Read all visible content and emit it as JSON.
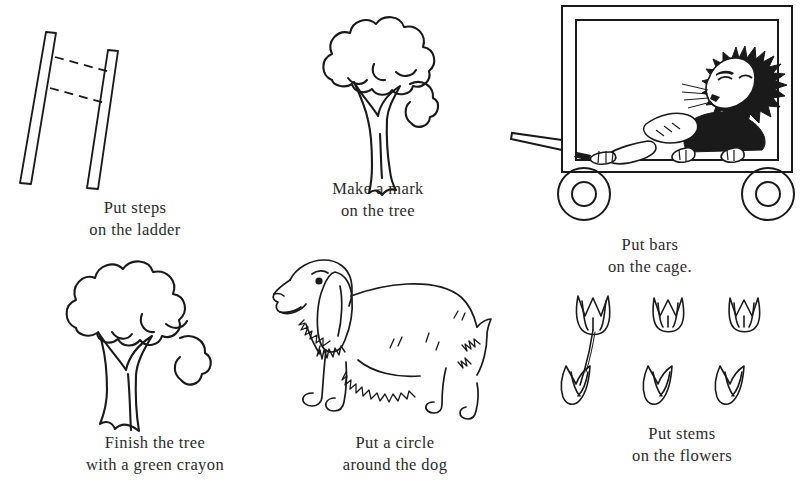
{
  "page": {
    "background_color": "#ffffff",
    "ink_color": "#1a1a1a",
    "text_color": "#2b2b2b",
    "type": "worksheet"
  },
  "exercises": [
    {
      "id": "ladder",
      "illustration": "ladder-drawing",
      "caption_line1": "Put steps",
      "caption_line2": "on the ladder"
    },
    {
      "id": "tree-mark",
      "illustration": "tree-drawing",
      "caption_line1": "Make a mark",
      "caption_line2": "on the tree"
    },
    {
      "id": "cage",
      "illustration": "lion-in-wagon-cage-drawing",
      "caption_line1": "Put bars",
      "caption_line2": "on the cage."
    },
    {
      "id": "tree-finish",
      "illustration": "tree-drawing",
      "caption_line1": "Finish the tree",
      "caption_line2": "with a green crayon"
    },
    {
      "id": "dog",
      "illustration": "cocker-spaniel-dog-drawing",
      "caption_line1": "Put a circle",
      "caption_line2": "around the dog"
    },
    {
      "id": "flowers",
      "illustration": "six-tulip-flowers-drawing",
      "caption_line1": "Put stems",
      "caption_line2": "on the flowers"
    }
  ]
}
